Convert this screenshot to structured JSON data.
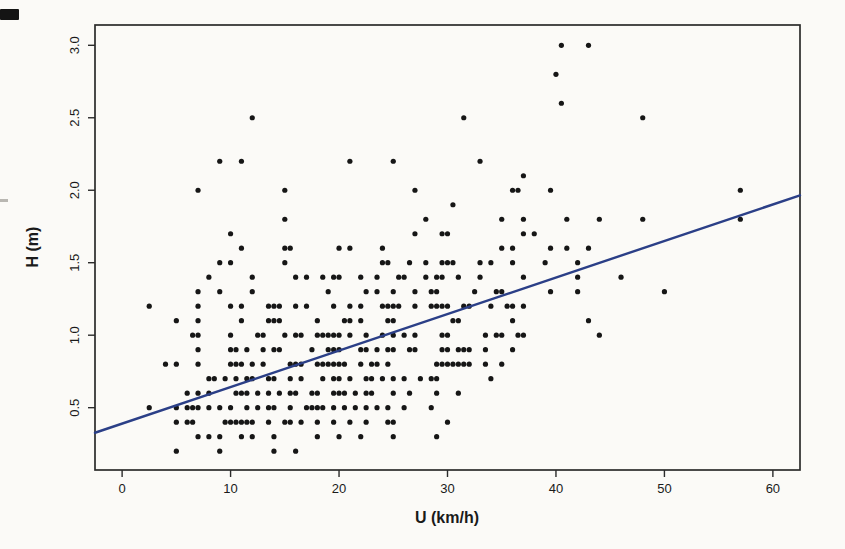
{
  "figure": {
    "background": "#fbfaf7",
    "box_color": "#2b2b2b",
    "tick_label_color": "#1a1a1a"
  },
  "chart_data": {
    "type": "scatter",
    "title": "",
    "xlabel": "U (km/h)",
    "ylabel": "H (m)",
    "xlim": [
      -2.5,
      62.5
    ],
    "ylim": [
      0.07,
      3.14
    ],
    "x_ticks": [
      0,
      10,
      20,
      30,
      40,
      50,
      60
    ],
    "x_tick_labels": [
      "0",
      "10",
      "20",
      "30",
      "40",
      "50",
      "60"
    ],
    "y_ticks": [
      0.5,
      1.0,
      1.5,
      2.0,
      2.5,
      3.0
    ],
    "y_tick_labels": [
      "0.5",
      "1.0",
      "1.5",
      "2.0",
      "2.5",
      "3.0"
    ],
    "grid": false,
    "legend": "none",
    "point_color": "#161616",
    "point_radius": 2.6,
    "regression_line": {
      "slope": 0.0252,
      "intercept": 0.39,
      "x_start": -2.5,
      "x_end": 62.5,
      "color": "#2b3f87",
      "width": 2.4
    },
    "points": [
      [
        40.5,
        3.0
      ],
      [
        43,
        3.0
      ],
      [
        40,
        2.8
      ],
      [
        40.5,
        2.6
      ],
      [
        12,
        2.5
      ],
      [
        31.5,
        2.5
      ],
      [
        48,
        2.5
      ],
      [
        9,
        2.2
      ],
      [
        11,
        2.2
      ],
      [
        21,
        2.2
      ],
      [
        25,
        2.2
      ],
      [
        33,
        2.2
      ],
      [
        37,
        2.1
      ],
      [
        7,
        2.0
      ],
      [
        15,
        2.0
      ],
      [
        27,
        2.0
      ],
      [
        36,
        2.0
      ],
      [
        36.5,
        2.0
      ],
      [
        39.5,
        2.0
      ],
      [
        57,
        2.0
      ],
      [
        30.5,
        1.9
      ],
      [
        15,
        1.8
      ],
      [
        28,
        1.8
      ],
      [
        35,
        1.8
      ],
      [
        37,
        1.8
      ],
      [
        41,
        1.8
      ],
      [
        44,
        1.8
      ],
      [
        48,
        1.8
      ],
      [
        57,
        1.8
      ],
      [
        10,
        1.7
      ],
      [
        27,
        1.7
      ],
      [
        29.5,
        1.7
      ],
      [
        30,
        1.7
      ],
      [
        37,
        1.7
      ],
      [
        38,
        1.7
      ],
      [
        11,
        1.6
      ],
      [
        15,
        1.6
      ],
      [
        15.5,
        1.6
      ],
      [
        20,
        1.6
      ],
      [
        21,
        1.6
      ],
      [
        24,
        1.6
      ],
      [
        35,
        1.6
      ],
      [
        36,
        1.6
      ],
      [
        39.5,
        1.6
      ],
      [
        41,
        1.6
      ],
      [
        43,
        1.6
      ],
      [
        9,
        1.5
      ],
      [
        10,
        1.5
      ],
      [
        15,
        1.5
      ],
      [
        24,
        1.5
      ],
      [
        24.5,
        1.5
      ],
      [
        26.5,
        1.5
      ],
      [
        28,
        1.5
      ],
      [
        29.5,
        1.5
      ],
      [
        30,
        1.5
      ],
      [
        30.5,
        1.5
      ],
      [
        33,
        1.5
      ],
      [
        34,
        1.5
      ],
      [
        36,
        1.5
      ],
      [
        39,
        1.5
      ],
      [
        42,
        1.5
      ],
      [
        8,
        1.4
      ],
      [
        12,
        1.4
      ],
      [
        16,
        1.4
      ],
      [
        17,
        1.4
      ],
      [
        18.5,
        1.4
      ],
      [
        19.5,
        1.4
      ],
      [
        20,
        1.4
      ],
      [
        22,
        1.4
      ],
      [
        23.5,
        1.4
      ],
      [
        25.5,
        1.4
      ],
      [
        26,
        1.4
      ],
      [
        28,
        1.4
      ],
      [
        29,
        1.4
      ],
      [
        29.5,
        1.4
      ],
      [
        31,
        1.4
      ],
      [
        33,
        1.4
      ],
      [
        37,
        1.4
      ],
      [
        42,
        1.4
      ],
      [
        46,
        1.4
      ],
      [
        7,
        1.3
      ],
      [
        9,
        1.3
      ],
      [
        12,
        1.3
      ],
      [
        19,
        1.3
      ],
      [
        22.5,
        1.3
      ],
      [
        23.5,
        1.3
      ],
      [
        25,
        1.3
      ],
      [
        27,
        1.3
      ],
      [
        28.5,
        1.3
      ],
      [
        29,
        1.3
      ],
      [
        32.5,
        1.3
      ],
      [
        34.5,
        1.3
      ],
      [
        35,
        1.3
      ],
      [
        39.5,
        1.3
      ],
      [
        42,
        1.3
      ],
      [
        50,
        1.3
      ],
      [
        2.5,
        1.2
      ],
      [
        7,
        1.2
      ],
      [
        10,
        1.2
      ],
      [
        11,
        1.2
      ],
      [
        13.5,
        1.2
      ],
      [
        14,
        1.2
      ],
      [
        14.5,
        1.2
      ],
      [
        16,
        1.2
      ],
      [
        17,
        1.2
      ],
      [
        19.5,
        1.2
      ],
      [
        21,
        1.2
      ],
      [
        22,
        1.2
      ],
      [
        24,
        1.2
      ],
      [
        24.5,
        1.2
      ],
      [
        25,
        1.2
      ],
      [
        25.5,
        1.2
      ],
      [
        27,
        1.2
      ],
      [
        28.5,
        1.2
      ],
      [
        29,
        1.2
      ],
      [
        29.5,
        1.2
      ],
      [
        30,
        1.2
      ],
      [
        31.5,
        1.2
      ],
      [
        32,
        1.2
      ],
      [
        34,
        1.2
      ],
      [
        35.5,
        1.2
      ],
      [
        36,
        1.2
      ],
      [
        37,
        1.2
      ],
      [
        5,
        1.1
      ],
      [
        7,
        1.1
      ],
      [
        11,
        1.1
      ],
      [
        13.5,
        1.1
      ],
      [
        14,
        1.1
      ],
      [
        14.5,
        1.1
      ],
      [
        18,
        1.1
      ],
      [
        20.5,
        1.1
      ],
      [
        21,
        1.1
      ],
      [
        22,
        1.1
      ],
      [
        24.5,
        1.1
      ],
      [
        25,
        1.1
      ],
      [
        30.5,
        1.1
      ],
      [
        31,
        1.1
      ],
      [
        36,
        1.1
      ],
      [
        43,
        1.1
      ],
      [
        6.5,
        1.0
      ],
      [
        7,
        1.0
      ],
      [
        10,
        1.0
      ],
      [
        12.5,
        1.0
      ],
      [
        13,
        1.0
      ],
      [
        15,
        1.0
      ],
      [
        16,
        1.0
      ],
      [
        16.5,
        1.0
      ],
      [
        18,
        1.0
      ],
      [
        18.5,
        1.0
      ],
      [
        19,
        1.0
      ],
      [
        19.5,
        1.0
      ],
      [
        20,
        1.0
      ],
      [
        21,
        1.0
      ],
      [
        22.5,
        1.0
      ],
      [
        24,
        1.0
      ],
      [
        25,
        1.0
      ],
      [
        26,
        1.0
      ],
      [
        27,
        1.0
      ],
      [
        29.5,
        1.0
      ],
      [
        30,
        1.0
      ],
      [
        33.5,
        1.0
      ],
      [
        34.5,
        1.0
      ],
      [
        35,
        1.0
      ],
      [
        36.5,
        1.0
      ],
      [
        37,
        1.0
      ],
      [
        44,
        1.0
      ],
      [
        7,
        0.9
      ],
      [
        10,
        0.9
      ],
      [
        10.5,
        0.9
      ],
      [
        11.5,
        0.9
      ],
      [
        13,
        0.9
      ],
      [
        14,
        0.9
      ],
      [
        14.5,
        0.9
      ],
      [
        17.5,
        0.9
      ],
      [
        19,
        0.9
      ],
      [
        19.5,
        0.9
      ],
      [
        20,
        0.9
      ],
      [
        22,
        0.9
      ],
      [
        22.5,
        0.9
      ],
      [
        23.5,
        0.9
      ],
      [
        24.5,
        0.9
      ],
      [
        25,
        0.9
      ],
      [
        26.5,
        0.9
      ],
      [
        27,
        0.9
      ],
      [
        29.5,
        0.9
      ],
      [
        30,
        0.9
      ],
      [
        31,
        0.9
      ],
      [
        31.5,
        0.9
      ],
      [
        32,
        0.9
      ],
      [
        33.5,
        0.9
      ],
      [
        36,
        0.9
      ],
      [
        4,
        0.8
      ],
      [
        5,
        0.8
      ],
      [
        7,
        0.8
      ],
      [
        10,
        0.8
      ],
      [
        10.5,
        0.8
      ],
      [
        11,
        0.8
      ],
      [
        12,
        0.8
      ],
      [
        13,
        0.8
      ],
      [
        15.5,
        0.8
      ],
      [
        16,
        0.8
      ],
      [
        16.5,
        0.8
      ],
      [
        18,
        0.8
      ],
      [
        18.5,
        0.8
      ],
      [
        19,
        0.8
      ],
      [
        19.5,
        0.8
      ],
      [
        20,
        0.8
      ],
      [
        20.5,
        0.8
      ],
      [
        22,
        0.8
      ],
      [
        23,
        0.8
      ],
      [
        23.5,
        0.8
      ],
      [
        24.5,
        0.8
      ],
      [
        29,
        0.8
      ],
      [
        29.5,
        0.8
      ],
      [
        30,
        0.8
      ],
      [
        30.5,
        0.8
      ],
      [
        31,
        0.8
      ],
      [
        31.5,
        0.8
      ],
      [
        32,
        0.8
      ],
      [
        33.5,
        0.8
      ],
      [
        35,
        0.8
      ],
      [
        8,
        0.7
      ],
      [
        8.5,
        0.7
      ],
      [
        9.5,
        0.7
      ],
      [
        10.5,
        0.7
      ],
      [
        11.5,
        0.7
      ],
      [
        12,
        0.7
      ],
      [
        13.5,
        0.7
      ],
      [
        14,
        0.7
      ],
      [
        15.5,
        0.7
      ],
      [
        16.5,
        0.7
      ],
      [
        18.5,
        0.7
      ],
      [
        19.5,
        0.7
      ],
      [
        20,
        0.7
      ],
      [
        21,
        0.7
      ],
      [
        22.5,
        0.7
      ],
      [
        23,
        0.7
      ],
      [
        24,
        0.7
      ],
      [
        25,
        0.7
      ],
      [
        26,
        0.7
      ],
      [
        27.5,
        0.7
      ],
      [
        28.5,
        0.7
      ],
      [
        29,
        0.7
      ],
      [
        34,
        0.7
      ],
      [
        6,
        0.6
      ],
      [
        7,
        0.6
      ],
      [
        8,
        0.6
      ],
      [
        10.5,
        0.6
      ],
      [
        11,
        0.6
      ],
      [
        11.5,
        0.6
      ],
      [
        12.5,
        0.6
      ],
      [
        13.5,
        0.6
      ],
      [
        14.5,
        0.6
      ],
      [
        15.5,
        0.6
      ],
      [
        16,
        0.6
      ],
      [
        17.5,
        0.6
      ],
      [
        18,
        0.6
      ],
      [
        19.5,
        0.6
      ],
      [
        20,
        0.6
      ],
      [
        20.5,
        0.6
      ],
      [
        21.5,
        0.6
      ],
      [
        22.5,
        0.6
      ],
      [
        23,
        0.6
      ],
      [
        25,
        0.6
      ],
      [
        26.5,
        0.6
      ],
      [
        29,
        0.6
      ],
      [
        31,
        0.6
      ],
      [
        2.5,
        0.5
      ],
      [
        5,
        0.5
      ],
      [
        6,
        0.5
      ],
      [
        6.5,
        0.5
      ],
      [
        7,
        0.5
      ],
      [
        8,
        0.5
      ],
      [
        9,
        0.5
      ],
      [
        10,
        0.5
      ],
      [
        11.5,
        0.5
      ],
      [
        12.5,
        0.5
      ],
      [
        13.5,
        0.5
      ],
      [
        14,
        0.5
      ],
      [
        15.5,
        0.5
      ],
      [
        17,
        0.5
      ],
      [
        17.5,
        0.5
      ],
      [
        18,
        0.5
      ],
      [
        18.5,
        0.5
      ],
      [
        19.5,
        0.5
      ],
      [
        20.5,
        0.5
      ],
      [
        21.5,
        0.5
      ],
      [
        22.5,
        0.5
      ],
      [
        23.5,
        0.5
      ],
      [
        24.5,
        0.5
      ],
      [
        26,
        0.5
      ],
      [
        28.5,
        0.5
      ],
      [
        5,
        0.4
      ],
      [
        6,
        0.4
      ],
      [
        6.5,
        0.4
      ],
      [
        9.5,
        0.4
      ],
      [
        10,
        0.4
      ],
      [
        10.5,
        0.4
      ],
      [
        11,
        0.4
      ],
      [
        11.5,
        0.4
      ],
      [
        12,
        0.4
      ],
      [
        13.5,
        0.4
      ],
      [
        15,
        0.4
      ],
      [
        15.5,
        0.4
      ],
      [
        16.5,
        0.4
      ],
      [
        18,
        0.4
      ],
      [
        19.5,
        0.4
      ],
      [
        21,
        0.4
      ],
      [
        22.5,
        0.4
      ],
      [
        24.5,
        0.4
      ],
      [
        25,
        0.4
      ],
      [
        30,
        0.4
      ],
      [
        7,
        0.3
      ],
      [
        8,
        0.3
      ],
      [
        9,
        0.3
      ],
      [
        11,
        0.3
      ],
      [
        12,
        0.3
      ],
      [
        14,
        0.3
      ],
      [
        18,
        0.3
      ],
      [
        20,
        0.3
      ],
      [
        22,
        0.3
      ],
      [
        25,
        0.3
      ],
      [
        29,
        0.3
      ],
      [
        5,
        0.2
      ],
      [
        9,
        0.2
      ],
      [
        14,
        0.2
      ],
      [
        16,
        0.2
      ]
    ]
  }
}
